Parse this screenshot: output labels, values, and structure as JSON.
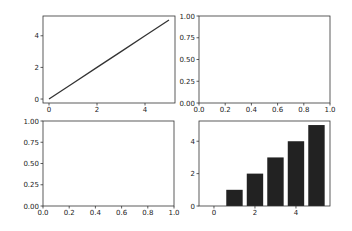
{
  "chart_data": [
    {
      "type": "line",
      "position": "top-left",
      "x": [
        0,
        1,
        2,
        3,
        4,
        5
      ],
      "series": [
        {
          "name": "line",
          "values": [
            0,
            1,
            2,
            3,
            4,
            5
          ],
          "color": "#333333"
        }
      ],
      "xlim": [
        -0.25,
        5.25
      ],
      "ylim": [
        -0.25,
        5.25
      ],
      "xticks": [
        "0",
        "2",
        "4"
      ],
      "yticks": [
        "0",
        "2",
        "4"
      ],
      "title": "",
      "xlabel": "",
      "ylabel": "",
      "grid": false
    },
    {
      "type": "line",
      "position": "top-right",
      "series": [],
      "xlim": [
        0,
        1
      ],
      "ylim": [
        0,
        1
      ],
      "xticks": [
        "0.0",
        "0.2",
        "0.4",
        "0.6",
        "0.8",
        "1.0"
      ],
      "yticks": [
        "0.00",
        "0.25",
        "0.50",
        "0.75",
        "1.00"
      ],
      "title": "",
      "xlabel": "",
      "ylabel": "",
      "grid": false
    },
    {
      "type": "line",
      "position": "bottom-left",
      "series": [],
      "xlim": [
        0,
        1
      ],
      "ylim": [
        0,
        1
      ],
      "xticks": [
        "0.0",
        "0.2",
        "0.4",
        "0.6",
        "0.8",
        "1.0"
      ],
      "yticks": [
        "0.00",
        "0.25",
        "0.50",
        "0.75",
        "1.00"
      ],
      "title": "",
      "xlabel": "",
      "ylabel": "",
      "grid": false
    },
    {
      "type": "bar",
      "position": "bottom-right",
      "categories": [
        0,
        1,
        2,
        3,
        4,
        5
      ],
      "values": [
        0,
        1,
        2,
        3,
        4,
        5
      ],
      "bar_color": "#222222",
      "bar_width": 0.8,
      "xlim": [
        -0.73,
        5.66
      ],
      "ylim": [
        0,
        5.25
      ],
      "xticks": [
        "0",
        "2",
        "4"
      ],
      "yticks": [
        "0",
        "2",
        "4"
      ],
      "title": "",
      "xlabel": "",
      "ylabel": "",
      "grid": false
    }
  ]
}
